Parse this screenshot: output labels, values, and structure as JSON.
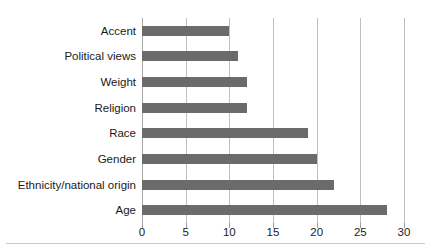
{
  "chart_data": {
    "type": "bar",
    "orientation": "horizontal",
    "title": "",
    "subtitle": "",
    "xlabel": "",
    "ylabel": "",
    "categories": [
      "Accent",
      "Political views",
      "Weight",
      "Religion",
      "Race",
      "Gender",
      "Ethnicity/national origin",
      "Age"
    ],
    "values": [
      10,
      11,
      12,
      12,
      19,
      20,
      22,
      28
    ],
    "xlim": [
      0,
      30
    ],
    "xticks": [
      0,
      5,
      10,
      15,
      20,
      25,
      30
    ],
    "xtick_labels": [
      "0",
      "5",
      "10",
      "15",
      "20",
      "25",
      "30"
    ],
    "grid": "vertical",
    "legend": "none",
    "bar_color": "#6b6b6b",
    "gridline_color": "#bfbfbf",
    "axis_color": "#a8a8a8",
    "text_color": "#1a1a1a"
  }
}
